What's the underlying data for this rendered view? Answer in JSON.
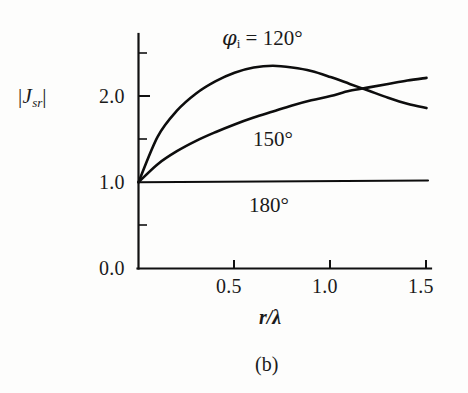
{
  "figure": {
    "caption": "(b)",
    "background_color": "#fdfdfc",
    "ink_color": "#0d0d0d"
  },
  "axes": {
    "y_label": "J",
    "y_label_sub": "sr",
    "y_label_bar": "|",
    "x_label": "r/λ",
    "y_ticks": [
      "0.0",
      "1.0",
      "2.0"
    ],
    "x_ticks": [
      "0.5",
      "1.0",
      "1.5"
    ]
  },
  "series_labels": {
    "first": {
      "phi": "φ",
      "sub": "i",
      "eq": " = 120°"
    },
    "second": "150°",
    "third": "180°"
  },
  "chart_data": {
    "type": "line",
    "title": "",
    "subtitle": "",
    "caption": "(b)",
    "xlabel": "r/λ",
    "ylabel": "|J_sr|",
    "xlim": [
      0.0,
      1.5
    ],
    "ylim": [
      0.0,
      2.5
    ],
    "xticks": [
      0.5,
      1.0,
      1.5
    ],
    "yticks": [
      0.0,
      1.0,
      2.0
    ],
    "yticks_minor": [
      0.5,
      1.5,
      2.5
    ],
    "grid": false,
    "legend": "inline-annotations",
    "annotations": [
      {
        "text": "φi = 120°",
        "x": 0.62,
        "y": 2.52
      },
      {
        "text": "150°",
        "x": 0.92,
        "y": 1.62
      },
      {
        "text": "180°",
        "x": 0.8,
        "y": 0.78
      }
    ],
    "x": [
      0.0,
      0.1,
      0.2,
      0.3,
      0.4,
      0.5,
      0.6,
      0.7,
      0.8,
      0.9,
      1.0,
      1.1,
      1.2,
      1.3,
      1.4,
      1.5
    ],
    "series": [
      {
        "name": "φi = 120°",
        "values": [
          1.0,
          1.53,
          1.83,
          2.03,
          2.17,
          2.27,
          2.33,
          2.35,
          2.33,
          2.29,
          2.22,
          2.14,
          2.06,
          1.98,
          1.91,
          1.86
        ]
      },
      {
        "name": "150°",
        "values": [
          1.0,
          1.21,
          1.36,
          1.48,
          1.58,
          1.67,
          1.75,
          1.82,
          1.89,
          1.95,
          2.0,
          2.06,
          2.1,
          2.14,
          2.18,
          2.21
        ]
      },
      {
        "name": "180°",
        "values": [
          1.0,
          1.01,
          1.02,
          1.02,
          1.02,
          1.02,
          1.02,
          1.02,
          1.02,
          1.02,
          1.02,
          1.02,
          1.02,
          1.02,
          1.02,
          1.02
        ]
      }
    ]
  }
}
